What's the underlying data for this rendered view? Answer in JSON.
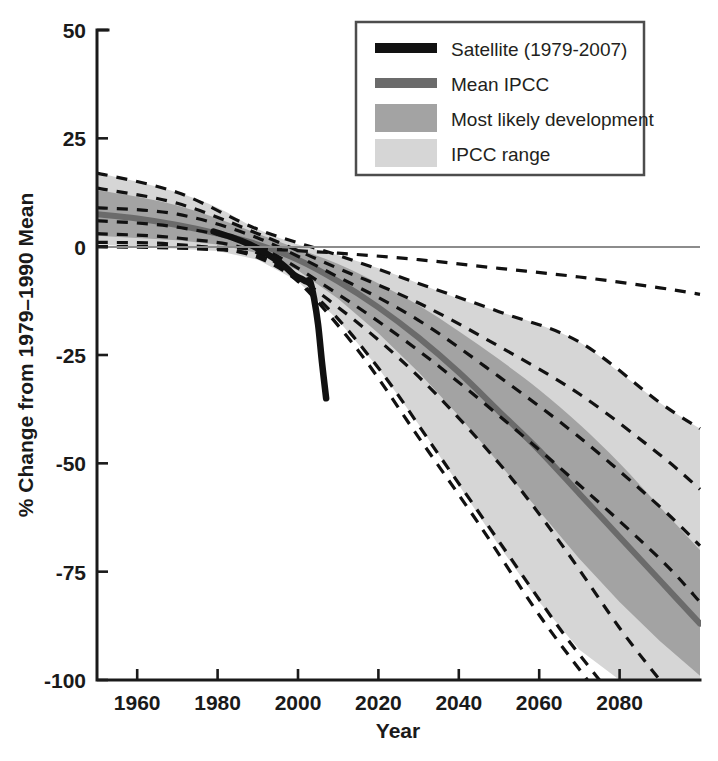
{
  "figure": {
    "background": "#ffffff",
    "plot_left_px": 97,
    "plot_right_px": 700,
    "plot_top_px": 30,
    "plot_bottom_px": 680
  },
  "colors": {
    "satellite_line": "#111111",
    "mean_ipcc_line": "#6b6b6b",
    "most_likely_band": "#a3a3a3",
    "ipcc_range_band": "#d6d6d6",
    "projection_dashed": "#111111",
    "axis": "#1a1a1a",
    "zero_line": "#8c8c8c",
    "legend_border": "#4d4d4d",
    "text": "#231f20"
  },
  "legend": {
    "position": "top-center-right",
    "border": true,
    "items": [
      {
        "label": "Satellite (1979-2007)",
        "swatch": "line",
        "color": "#111111"
      },
      {
        "label": "Mean IPCC",
        "swatch": "line",
        "color": "#6b6b6b"
      },
      {
        "label": "Most likely development",
        "swatch": "band",
        "color": "#a3a3a3"
      },
      {
        "label": "IPCC range",
        "swatch": "band",
        "color": "#d6d6d6"
      }
    ]
  },
  "chart_data": {
    "type": "line",
    "title": "",
    "subtitle": "",
    "xlabel": "Year",
    "ylabel": "% Change from 1979–1990 Mean",
    "xlim": [
      1950,
      2100
    ],
    "ylim": [
      -100,
      50
    ],
    "xticks": [
      1960,
      1980,
      2000,
      2020,
      2040,
      2060,
      2080
    ],
    "xticklabels": [
      "1960",
      "1980",
      "2000",
      "2020",
      "2040",
      "2060",
      "2080"
    ],
    "yticks": [
      50,
      25,
      0,
      -25,
      -50,
      -75,
      -100
    ],
    "yticklabels": [
      "50",
      "25",
      "0",
      "-25",
      "-50",
      "-75",
      "-100"
    ],
    "grid": false,
    "zero_reference_line": 0,
    "legend_position": "upper center",
    "series": [
      {
        "name": "Satellite (1979-2007)",
        "style": "solid-thick-black",
        "x": [
          1979,
          1984,
          1988,
          1992,
          1996,
          1999,
          2001,
          2002,
          2003,
          2004,
          2005,
          2006,
          2007
        ],
        "values": [
          3.5,
          2.0,
          0.5,
          -1.5,
          -4.0,
          -6.5,
          -7.5,
          -8.0,
          -8.0,
          -12.0,
          -18.0,
          -27.0,
          -35.0
        ]
      },
      {
        "name": "Mean IPCC",
        "style": "solid-thick-gray",
        "x": [
          1950,
          1960,
          1970,
          1980,
          1990,
          2000,
          2010,
          2020,
          2030,
          2040,
          2050,
          2060,
          2070,
          2080,
          2090,
          2100
        ],
        "values": [
          7.5,
          6.5,
          5.0,
          3.0,
          0.5,
          -3.0,
          -8.0,
          -14.0,
          -21.0,
          -29.0,
          -38.0,
          -47.0,
          -57.0,
          -67.0,
          -77.0,
          -87.0
        ]
      },
      {
        "name": "Most likely development upper bound",
        "style": "band-edge",
        "x": [
          1950,
          1960,
          1970,
          1980,
          1990,
          2000,
          2010,
          2020,
          2030,
          2040,
          2050,
          2060,
          2070,
          2080,
          2090,
          2100
        ],
        "values": [
          13.0,
          11.5,
          9.5,
          6.5,
          3.0,
          -0.5,
          -4.0,
          -8.5,
          -13.5,
          -19.5,
          -26.0,
          -33.0,
          -41.0,
          -50.0,
          -60.0,
          -70.0
        ]
      },
      {
        "name": "Most likely development lower bound",
        "style": "band-edge",
        "x": [
          1950,
          1960,
          1970,
          1980,
          1990,
          2000,
          2010,
          2020,
          2030,
          2040,
          2050,
          2060,
          2070,
          2080,
          2090,
          2100
        ],
        "values": [
          2.5,
          2.0,
          1.5,
          0.5,
          -1.5,
          -5.5,
          -12.0,
          -20.0,
          -29.0,
          -39.0,
          -50.0,
          -61.0,
          -72.0,
          -82.0,
          -91.0,
          -99.0
        ]
      },
      {
        "name": "IPCC range upper bound",
        "style": "band-edge",
        "x": [
          1950,
          1960,
          1970,
          1980,
          1990,
          2000,
          2010,
          2020,
          2030,
          2040,
          2050,
          2060,
          2070,
          2080,
          2090,
          2100
        ],
        "values": [
          17.0,
          15.0,
          12.5,
          9.0,
          4.0,
          0.5,
          -2.0,
          -5.0,
          -8.5,
          -12.0,
          -15.0,
          -18.0,
          -22.0,
          -29.0,
          -36.0,
          -42.0
        ]
      },
      {
        "name": "IPCC range lower bound",
        "style": "band-edge",
        "x": [
          1950,
          1960,
          1970,
          1980,
          1990,
          2000,
          2010,
          2020,
          2030,
          2040,
          2050,
          2060,
          2070,
          2080,
          2090,
          2100
        ],
        "values": [
          0.5,
          0.0,
          -0.5,
          -1.0,
          -3.0,
          -8.0,
          -17.0,
          -28.0,
          -41.0,
          -55.0,
          -69.0,
          -82.0,
          -93.0,
          -100.0,
          -100.0,
          -100.0
        ]
      },
      {
        "name": "Model projection 1",
        "style": "dashed-black",
        "x": [
          1950,
          1970,
          1990,
          2010,
          2030,
          2050,
          2070,
          2090,
          2100
        ],
        "values": [
          17.0,
          12.5,
          4.0,
          -2.0,
          -8.5,
          -15.0,
          -22.0,
          -36.0,
          -42.0
        ]
      },
      {
        "name": "Model projection 2",
        "style": "dashed-black",
        "x": [
          1950,
          1970,
          1990,
          2010,
          2030,
          2050,
          2070,
          2090,
          2100
        ],
        "values": [
          13.5,
          10.0,
          3.0,
          -5.0,
          -13.0,
          -23.0,
          -34.0,
          -48.0,
          -56.0
        ]
      },
      {
        "name": "Model projection 3",
        "style": "dashed-black",
        "x": [
          1950,
          1970,
          1990,
          2010,
          2030,
          2050,
          2070,
          2090,
          2100
        ],
        "values": [
          9.0,
          7.5,
          2.0,
          -7.0,
          -17.0,
          -30.0,
          -44.0,
          -60.0,
          -69.0
        ]
      },
      {
        "name": "Model projection 4",
        "style": "dashed-black",
        "x": [
          1950,
          1970,
          1990,
          2010,
          2030,
          2050,
          2070,
          2090,
          2100
        ],
        "values": [
          6.0,
          4.5,
          0.0,
          -11.0,
          -24.0,
          -39.0,
          -55.0,
          -72.0,
          -82.0
        ]
      },
      {
        "name": "Model projection 5",
        "style": "dashed-black",
        "x": [
          1950,
          1970,
          1990,
          2010,
          2030,
          2050,
          2065,
          2080,
          2090
        ],
        "values": [
          3.0,
          2.0,
          -1.5,
          -14.0,
          -30.0,
          -50.0,
          -68.0,
          -88.0,
          -100.0
        ]
      },
      {
        "name": "Model projection 6",
        "style": "dashed-black",
        "x": [
          1950,
          1970,
          1990,
          2005,
          2020,
          2035,
          2050,
          2065,
          2075
        ],
        "values": [
          1.0,
          0.5,
          -2.5,
          -12.0,
          -28.0,
          -48.0,
          -68.0,
          -88.0,
          -100.0
        ]
      },
      {
        "name": "Model projection 7",
        "style": "dashed-black",
        "x": [
          1950,
          1975,
          1990,
          2000,
          2015,
          2030,
          2045,
          2060,
          2072
        ],
        "values": [
          0.0,
          -0.5,
          -2.0,
          -8.0,
          -24.0,
          -44.0,
          -64.0,
          -85.0,
          -100.0
        ]
      },
      {
        "name": "Model projection 8 flat",
        "style": "dashed-black",
        "x": [
          1950,
          1970,
          1990,
          2010,
          2030,
          2050,
          2070,
          2090,
          2100
        ],
        "values": [
          0.0,
          0.0,
          -0.5,
          -1.5,
          -3.0,
          -5.0,
          -7.0,
          -9.5,
          -11.0
        ]
      }
    ]
  }
}
